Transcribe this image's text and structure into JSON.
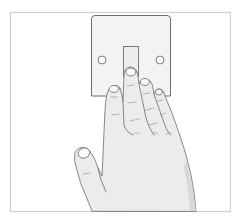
{
  "illustration": {
    "description": "Hand pressing a light switch with fingers",
    "alt": "Illustration of a hand pressing a wall light switch",
    "colors": {
      "background": "#ffffff",
      "frame_stroke": "#cfcfcf",
      "plate_fill": "#f2f2f2",
      "plate_stroke": "#6f6f6f",
      "skin_fill": "#e9e9e9",
      "skin_shadow": "#d6d6d6",
      "outline": "#7a7a7a",
      "nail_fill": "#fafafa"
    },
    "elements": [
      "frame",
      "switch-plate",
      "screw-left",
      "screw-right",
      "toggle",
      "hand"
    ]
  }
}
